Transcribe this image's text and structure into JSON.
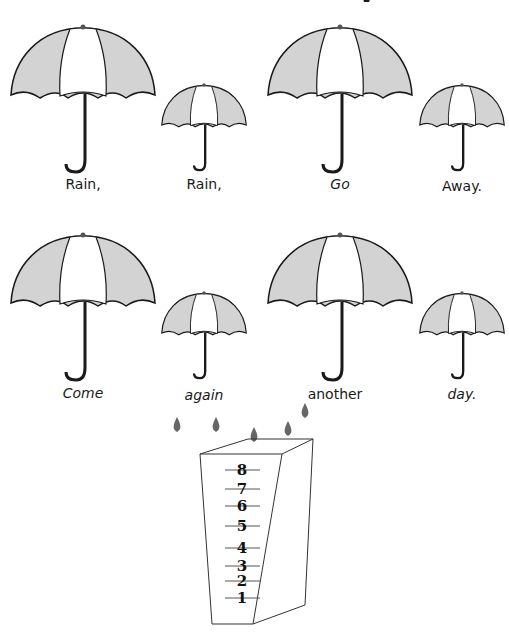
{
  "title_fragment": "y",
  "colors": {
    "canopy_shade": "#d3d3d3",
    "canopy_light": "#ffffff",
    "outline": "#1a1a1a",
    "raindrop": "#666666"
  },
  "umbrellas": [
    {
      "word": "Rain,",
      "size": "large",
      "style": "normal"
    },
    {
      "word": "Rain,",
      "size": "small",
      "style": "normal"
    },
    {
      "word": "Go",
      "size": "large",
      "style": "italic"
    },
    {
      "word": "Away.",
      "size": "small",
      "style": "normal"
    },
    {
      "word": "Come",
      "size": "large",
      "style": "italic"
    },
    {
      "word": "again",
      "size": "small",
      "style": "italic"
    },
    {
      "word": "another",
      "size": "large",
      "style": "normal"
    },
    {
      "word": "day.",
      "size": "small",
      "style": "italic"
    }
  ],
  "rain_gauge": {
    "raindrops": 5,
    "scale": [
      "8",
      "7",
      "6",
      "5",
      "4",
      "3",
      "2",
      "1"
    ]
  }
}
